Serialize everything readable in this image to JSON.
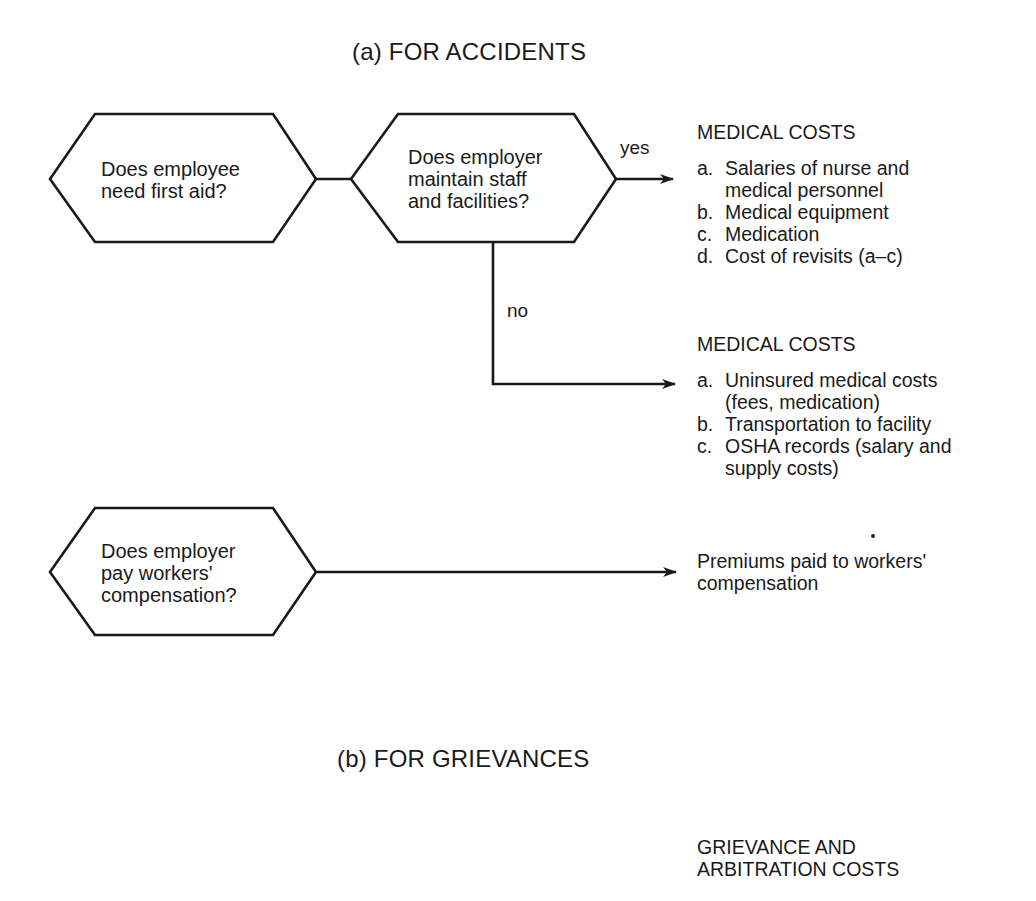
{
  "section_a": {
    "title": "(a) FOR ACCIDENTS",
    "nodes": [
      {
        "id": "first-aid",
        "lines": [
          "Does employee",
          "need first aid?"
        ]
      },
      {
        "id": "staff-facilities",
        "lines": [
          "Does employer",
          "maintain staff",
          "and facilities?"
        ]
      },
      {
        "id": "workers-comp",
        "lines": [
          "Does employer",
          "pay workers'",
          "compensation?"
        ]
      }
    ],
    "edges": {
      "yes_label": "yes",
      "no_label": "no"
    },
    "outcomes": {
      "yes_block": {
        "heading": "MEDICAL COSTS",
        "items": [
          {
            "marker": "a.",
            "lines": [
              "Salaries of nurse and",
              "medical personnel"
            ]
          },
          {
            "marker": "b.",
            "lines": [
              "Medical equipment"
            ]
          },
          {
            "marker": "c.",
            "lines": [
              "Medication"
            ]
          },
          {
            "marker": "d.",
            "lines": [
              "Cost of revisits (a–c)"
            ]
          }
        ]
      },
      "no_block": {
        "heading": "MEDICAL COSTS",
        "items": [
          {
            "marker": "a.",
            "lines": [
              "Uninsured medical costs",
              "(fees, medication)"
            ]
          },
          {
            "marker": "b.",
            "lines": [
              "Transportation to facility"
            ]
          },
          {
            "marker": "c.",
            "lines": [
              "OSHA records (salary and",
              "supply costs)"
            ]
          }
        ]
      },
      "comp_block": {
        "lines": [
          "Premiums paid to workers'",
          "compensation"
        ]
      }
    }
  },
  "section_b": {
    "title": "(b) FOR GRIEVANCES",
    "outcomes": {
      "heading_lines": [
        "GRIEVANCE AND",
        "ARBITRATION COSTS"
      ]
    }
  },
  "colors": {
    "stroke": "#1a1a1a",
    "background": "#ffffff"
  }
}
